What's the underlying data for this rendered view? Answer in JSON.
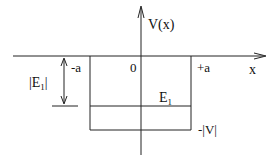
{
  "diagram": {
    "axes": {
      "x_label": "x",
      "y_label": "V(x)",
      "origin_label": "0"
    },
    "well": {
      "left_label": "-a",
      "right_label": "+a",
      "depth_label": "-|V|"
    },
    "energy_level": {
      "label_main": "E",
      "label_sub": "1"
    },
    "binding_energy": {
      "label_prefix": "|E",
      "label_sub": "1",
      "label_suffix": "|"
    },
    "colors": {
      "line": "#222222",
      "background": "#ffffff"
    }
  }
}
